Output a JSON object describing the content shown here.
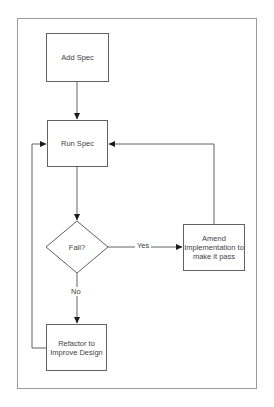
{
  "diagram": {
    "nodes": {
      "add_spec": {
        "label": "Add Spec",
        "shape": "rect"
      },
      "run_spec": {
        "label": "Run Spec",
        "shape": "rect"
      },
      "fail": {
        "label": "Fail?",
        "shape": "diamond"
      },
      "amend": {
        "label": "Amend\nImplementation to\nmake it pass",
        "shape": "rect"
      },
      "refactor": {
        "label": "Refactor to\nImprove Design",
        "shape": "rect"
      }
    },
    "edge_labels": {
      "yes": "Yes",
      "no": "No"
    },
    "colors": {
      "background": "#ffffff",
      "outer_border": "#9b9b9b",
      "shape_stroke": "#616161",
      "arrow_fill": "#1c1c1c",
      "text": "#3f4245"
    }
  }
}
